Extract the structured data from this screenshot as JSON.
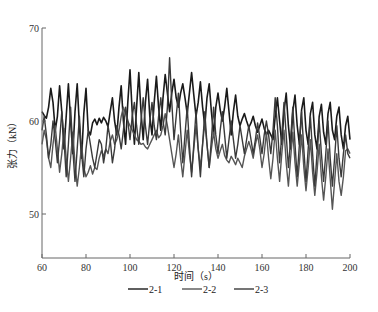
{
  "chart_data": {
    "type": "line",
    "title": "",
    "xlabel": "时间（s）",
    "ylabel": "张力（kN）",
    "xlim": [
      60,
      200
    ],
    "ylim": [
      45.3,
      70
    ],
    "x_ticks": [
      60,
      80,
      100,
      120,
      140,
      160,
      180,
      200
    ],
    "y_ticks": [
      50,
      60,
      70
    ],
    "grid": false,
    "legend_position": "bottom",
    "x_start": 60,
    "x_step": 1,
    "series": [
      {
        "name": "2-1",
        "color": "#1a1a1a",
        "width": 1.6,
        "values": [
          61.0,
          60.6,
          60.3,
          61.5,
          63.5,
          62.0,
          59.0,
          60.5,
          63.8,
          61.0,
          57.0,
          60.5,
          64.0,
          60.0,
          56.5,
          61.0,
          64.0,
          59.5,
          56.0,
          60.8,
          63.5,
          59.0,
          58.5,
          59.8,
          60.2,
          59.6,
          60.3,
          59.8,
          60.4,
          60.0,
          59.4,
          61.0,
          62.5,
          60.0,
          58.5,
          61.5,
          63.8,
          60.0,
          57.5,
          62.0,
          65.5,
          61.0,
          57.5,
          61.5,
          65.2,
          61.0,
          58.0,
          62.0,
          64.5,
          60.5,
          58.5,
          62.0,
          64.8,
          61.5,
          59.0,
          62.5,
          65.0,
          63.0,
          61.0,
          63.0,
          64.5,
          62.5,
          61.5,
          63.0,
          64.0,
          62.5,
          60.8,
          63.0,
          65.2,
          62.8,
          60.5,
          62.0,
          64.2,
          61.5,
          59.5,
          62.5,
          64.0,
          61.0,
          58.5,
          61.5,
          63.0,
          61.2,
          60.0,
          61.5,
          63.5,
          61.0,
          58.5,
          61.0,
          62.8,
          60.5,
          59.5,
          60.2,
          60.8,
          60.0,
          59.3,
          59.8,
          60.5,
          59.5,
          58.8,
          59.5,
          60.2,
          59.2,
          58.5,
          59.0,
          58.5,
          58.0,
          60.5,
          62.5,
          60.0,
          57.5,
          61.0,
          63.0,
          59.5,
          57.0,
          61.0,
          62.8,
          59.5,
          57.5,
          61.2,
          62.5,
          59.0,
          57.5,
          60.8,
          62.0,
          58.5,
          57.0,
          60.5,
          61.8,
          58.8,
          57.5,
          60.8,
          62.0,
          59.0,
          58.0,
          60.5,
          61.5,
          58.5,
          57.0,
          59.5,
          60.5,
          58.0
        ]
      },
      {
        "name": "2-2",
        "color": "#555555",
        "width": 1.4,
        "values": [
          57.5,
          59.0,
          58.0,
          56.0,
          55.0,
          57.5,
          59.5,
          57.0,
          54.5,
          56.5,
          59.2,
          56.0,
          53.5,
          56.0,
          58.8,
          55.5,
          53.0,
          55.0,
          57.5,
          55.0,
          54.0,
          54.5,
          55.2,
          54.3,
          55.0,
          54.8,
          56.0,
          56.8,
          56.2,
          57.0,
          56.5,
          57.8,
          58.5,
          57.5,
          58.0,
          59.0,
          60.5,
          61.5,
          60.8,
          60.0,
          59.5,
          59.0,
          58.5,
          58.0,
          57.8,
          57.5,
          57.6,
          57.2,
          57.0,
          57.5,
          58.0,
          58.5,
          59.0,
          58.2,
          58.5,
          59.5,
          60.8,
          59.5,
          58.0,
          56.5,
          55.0,
          56.5,
          58.5,
          56.0,
          54.0,
          56.5,
          59.0,
          56.5,
          54.5,
          57.0,
          59.5,
          57.0,
          55.0,
          57.5,
          59.8,
          57.5,
          55.0,
          57.0,
          58.8,
          57.0,
          56.0,
          56.8,
          57.5,
          56.3,
          55.8,
          55.5,
          56.2,
          55.8,
          55.3,
          56.0,
          55.5,
          55.0,
          56.2,
          57.0,
          57.8,
          57.0,
          56.0,
          57.5,
          58.5,
          57.0,
          55.0,
          56.5,
          58.8,
          56.0,
          53.8,
          56.0,
          59.0,
          56.0,
          53.5,
          56.5,
          59.0,
          55.5,
          53.0,
          56.0,
          58.8,
          55.5,
          53.0,
          55.5,
          58.5,
          55.0,
          52.5,
          55.0,
          58.0,
          54.5,
          52.0,
          54.5,
          57.5,
          54.0,
          51.5,
          54.0,
          57.0,
          53.8,
          50.5,
          53.5,
          56.5,
          53.5,
          52.0,
          54.0,
          56.8,
          57.0,
          56.5
        ]
      },
      {
        "name": "2-3",
        "color": "#3a3a3a",
        "width": 1.4,
        "values": [
          59.0,
          60.5,
          58.5,
          56.0,
          57.5,
          60.0,
          58.0,
          55.5,
          58.0,
          61.0,
          58.0,
          54.0,
          57.5,
          61.5,
          57.0,
          53.5,
          57.0,
          60.5,
          56.5,
          54.0,
          57.0,
          59.0,
          57.5,
          56.0,
          55.0,
          56.5,
          58.0,
          57.5,
          55.5,
          57.0,
          59.5,
          58.0,
          55.5,
          57.0,
          59.5,
          58.5,
          57.0,
          59.0,
          61.5,
          60.0,
          58.0,
          60.5,
          62.0,
          59.5,
          57.5,
          60.0,
          62.5,
          59.5,
          57.5,
          60.0,
          62.0,
          59.5,
          58.0,
          60.5,
          62.5,
          60.0,
          58.5,
          61.5,
          66.8,
          62.0,
          58.0,
          60.5,
          63.0,
          59.0,
          55.5,
          58.5,
          61.5,
          57.5,
          54.0,
          57.5,
          61.0,
          57.0,
          54.0,
          57.5,
          61.0,
          57.5,
          55.0,
          58.0,
          61.5,
          58.5,
          56.5,
          59.0,
          61.0,
          58.5,
          56.0,
          58.0,
          60.0,
          58.0,
          56.0,
          57.5,
          59.5,
          58.0,
          56.5,
          58.0,
          59.5,
          58.0,
          56.5,
          58.0,
          59.8,
          58.2,
          56.5,
          58.5,
          60.0,
          58.5,
          56.5,
          59.0,
          62.5,
          59.5,
          55.5,
          58.5,
          62.0,
          58.5,
          55.0,
          58.0,
          61.5,
          57.5,
          54.0,
          57.5,
          61.0,
          57.0,
          53.5,
          57.0,
          60.5,
          56.5,
          53.0,
          56.5,
          60.0,
          56.5,
          53.5,
          56.5,
          60.0,
          56.0,
          53.0,
          56.0,
          59.5,
          56.0,
          54.0,
          56.5,
          58.5,
          56.5,
          56.0
        ]
      }
    ]
  },
  "axes": {
    "y_label": "张力（kN）",
    "x_label": "时间（s）",
    "x_tick_labels": [
      "60",
      "80",
      "100",
      "120",
      "140",
      "160",
      "180",
      "200"
    ],
    "y_tick_labels": [
      "50",
      "60",
      "70"
    ]
  },
  "legend": {
    "items": [
      {
        "label": "2-1",
        "color": "#1a1a1a"
      },
      {
        "label": "2-2",
        "color": "#555555"
      },
      {
        "label": "2-3",
        "color": "#3a3a3a"
      }
    ]
  }
}
